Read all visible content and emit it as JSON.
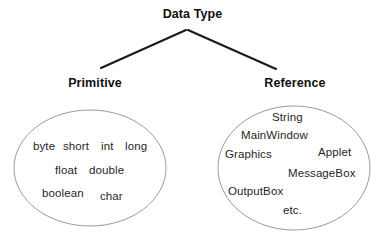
{
  "diagram": {
    "type": "tree-with-set-ellipses",
    "root": {
      "label": "Data Type"
    },
    "branches": [
      {
        "label": "Primitive",
        "items": [
          "byte",
          "short",
          "int",
          "long",
          "float",
          "double",
          "boolean",
          "char"
        ]
      },
      {
        "label": "Reference",
        "items": [
          "String",
          "MainWindow",
          "Graphics",
          "Applet",
          "MessageBox",
          "OutputBox",
          "etc."
        ]
      }
    ],
    "colors": {
      "background": "#ffffff",
      "text": "#1a1a1a",
      "connector": "#1a1a1a",
      "ellipse_stroke": "#9a9a9a"
    }
  }
}
